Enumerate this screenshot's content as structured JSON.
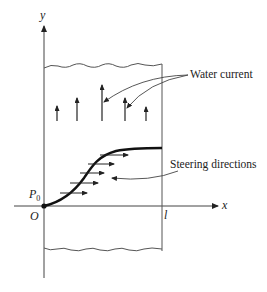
{
  "figure": {
    "labels": {
      "y_axis": "y",
      "x_axis": "x",
      "origin": "O",
      "start_point": "P",
      "start_point_sub": "0",
      "far_bank": "l",
      "water_current": "Water current",
      "steering_directions": "Steering directions"
    },
    "colors": {
      "stroke": "#333333",
      "curve": "#111111",
      "background": "#ffffff"
    }
  }
}
